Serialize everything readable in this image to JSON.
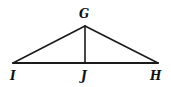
{
  "figure": {
    "kind": "geometry-diagram",
    "background_color": "#ffffff",
    "stroke_color": "#1a1a1a",
    "base_stroke_width": 2.2,
    "side_stroke_width": 1.6,
    "altitude_stroke_width": 1.6,
    "vertices": [
      {
        "id": "G",
        "label": "G",
        "x": 85,
        "y": 26,
        "role": "apex"
      },
      {
        "id": "I",
        "label": "I",
        "x": 13,
        "y": 63,
        "role": "base-left"
      },
      {
        "id": "J",
        "label": "J",
        "x": 85,
        "y": 63,
        "role": "foot-of-altitude"
      },
      {
        "id": "H",
        "label": "H",
        "x": 158,
        "y": 63,
        "role": "base-right"
      }
    ],
    "segments": [
      {
        "id": "GI",
        "from": "G",
        "to": "I",
        "name": "left-side"
      },
      {
        "id": "GH",
        "from": "G",
        "to": "H",
        "name": "right-side"
      },
      {
        "id": "IH",
        "from": "I",
        "to": "H",
        "name": "base"
      },
      {
        "id": "GJ",
        "from": "G",
        "to": "J",
        "name": "altitude"
      }
    ],
    "labels": {
      "G": "G",
      "I": "I",
      "J": "J",
      "H": "H"
    }
  }
}
